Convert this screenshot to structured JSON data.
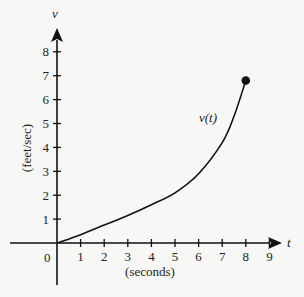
{
  "chart_data": {
    "type": "line",
    "title": "",
    "xlabel": "(seconds)",
    "ylabel": "(feet/sec)",
    "x_axis_name": "t",
    "y_axis_name": "v",
    "curve_label": "v(t)",
    "origin_label": "0",
    "x_ticks": [
      "1",
      "2",
      "3",
      "4",
      "5",
      "6",
      "7",
      "8",
      "9"
    ],
    "y_ticks": [
      "1",
      "2",
      "3",
      "4",
      "5",
      "6",
      "7",
      "8"
    ],
    "xlim": [
      -1.5,
      9.8
    ],
    "ylim": [
      -1.2,
      8.8
    ],
    "grid": false,
    "series": [
      {
        "name": "v(t)",
        "x": [
          0,
          1,
          2,
          3,
          4,
          5,
          6,
          7,
          7.5,
          8
        ],
        "y": [
          0,
          0.35,
          0.75,
          1.15,
          1.6,
          2.1,
          2.9,
          4.2,
          5.3,
          6.8
        ]
      }
    ],
    "endpoint": {
      "t": 8,
      "v": 6.8,
      "marker": "filled-circle"
    }
  }
}
